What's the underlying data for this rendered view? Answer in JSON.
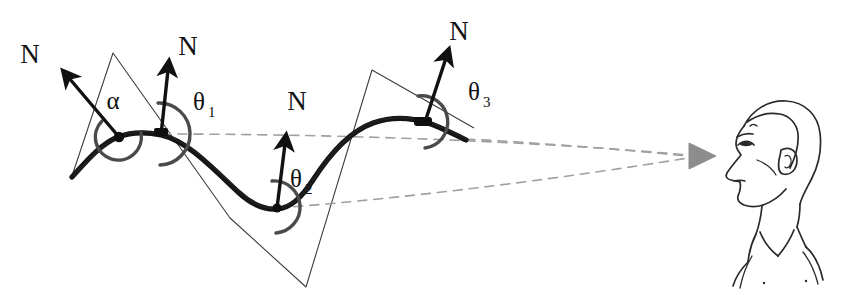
{
  "figure": {
    "background_color": "#ffffff",
    "ink_color": "#111111",
    "thin_line_color": "#3a3a3a",
    "dashed_line_color": "#9a9a9a",
    "arc_color": "#555555",
    "sight_arrow_color": "#8a8a8a"
  },
  "labels": {
    "normal_1": "N",
    "normal_2": "N",
    "normal_3": "N",
    "normal_4": "N",
    "alpha": "α",
    "theta": "θ",
    "theta1_sub": "1",
    "theta2_sub": "2",
    "theta3_sub": "3"
  },
  "annotations": [
    {
      "name": "normal-label-1",
      "text": "N",
      "x": 30,
      "y": 48
    },
    {
      "name": "normal-label-2",
      "text": "N",
      "x": 180,
      "y": 42
    },
    {
      "name": "normal-label-3",
      "text": "N",
      "x": 289,
      "y": 97
    },
    {
      "name": "normal-label-4",
      "text": "N",
      "x": 451,
      "y": 32
    },
    {
      "name": "angle-label-alpha",
      "text": "α",
      "x": 104,
      "y": 103
    },
    {
      "name": "angle-label-theta1",
      "text": "θ",
      "sub": "1",
      "x": 193,
      "y": 109
    },
    {
      "name": "angle-label-theta2",
      "text": "θ",
      "sub": "2",
      "x": 291,
      "y": 185
    },
    {
      "name": "angle-label-theta3",
      "text": "θ",
      "sub": "3",
      "x": 470,
      "y": 98
    }
  ],
  "geometry": {
    "surface_curve": "M 72,176 C 86,162 100,142 118,136 C 130,133 146,133 160,136 C 186,142 214,170 238,192 C 252,205 264,209 276,208 C 290,207 300,198 312,180 C 330,152 350,132 372,124 C 392,117 410,118 424,122 C 440,127 452,134 464,139",
    "facet_polyline": "M 72,176 L 113,53 L 230,218 L 306,287 L 372,70 L 472,127",
    "normals": [
      {
        "name": "normal-vector-1",
        "from": [
          118,
          136
        ],
        "to": [
          64,
          72
        ],
        "label_at": [
          30,
          48
        ]
      },
      {
        "name": "normal-vector-2",
        "from": [
          160,
          134
        ],
        "to": [
          168,
          60
        ],
        "label_at": [
          180,
          42
        ]
      },
      {
        "name": "normal-vector-3",
        "from": [
          276,
          207
        ],
        "to": [
          288,
          135
        ],
        "label_at": [
          289,
          97
        ]
      },
      {
        "name": "normal-vector-4",
        "from": [
          424,
          122
        ],
        "to": [
          450,
          48
        ],
        "label_at": [
          451,
          32
        ]
      }
    ],
    "angle_arcs": [
      {
        "name": "angle-arc-alpha",
        "center": [
          118,
          136
        ],
        "radius": 24
      },
      {
        "name": "angle-arc-theta1",
        "center": [
          160,
          134
        ],
        "radius": 31
      },
      {
        "name": "angle-arc-theta2",
        "center": [
          276,
          207
        ],
        "radius": 26
      },
      {
        "name": "angle-arc-theta3",
        "center": [
          424,
          122
        ],
        "radius": 26
      }
    ],
    "sight_lines": [
      {
        "name": "sight-line-top",
        "path": "M 160,134 C 300,136 520,140 690,155"
      },
      {
        "name": "sight-line-middle",
        "path": "M 464,137 C 540,142 620,148 690,156"
      },
      {
        "name": "sight-line-bottom",
        "path": "M 276,207 C 420,196 570,176 690,158"
      }
    ],
    "viewer_arrow": {
      "name": "viewing-direction-arrow",
      "tip": [
        714,
        156
      ]
    }
  },
  "viewer": {
    "name": "observer-head-illustration",
    "description": "line drawing of a man's head in profile facing left"
  }
}
